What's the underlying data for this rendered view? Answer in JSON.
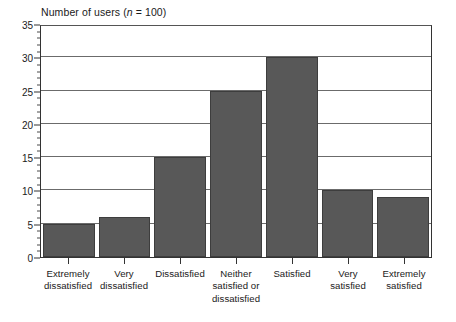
{
  "chart_data": {
    "type": "bar",
    "title": "Number of users (n = 100)",
    "title_prefix": "Number of users (",
    "title_italic": "n",
    "title_suffix": " = 100)",
    "xlabel": "",
    "ylabel": "",
    "ylim": [
      0,
      35
    ],
    "ytick_step": 5,
    "yminor_step": 1,
    "grid": "horizontal-major",
    "legend": "none",
    "bar_color": "#585858",
    "bar_edge_color": "#3d3d3d",
    "categories": [
      "Extremely\ndissatisfied",
      "Very\ndissatisfied",
      "Dissatisfied",
      "Neither\nsatisfied or\ndissatisfied",
      "Satisfied",
      "Very\nsatisfied",
      "Extremely\nsatisfied"
    ],
    "values": [
      5,
      6,
      15,
      25,
      30,
      10,
      9
    ],
    "yticks": [
      0,
      5,
      10,
      15,
      20,
      25,
      30,
      35
    ],
    "ytick_labels": [
      "0",
      "5",
      "10",
      "15",
      "20",
      "25",
      "30",
      "35"
    ]
  }
}
